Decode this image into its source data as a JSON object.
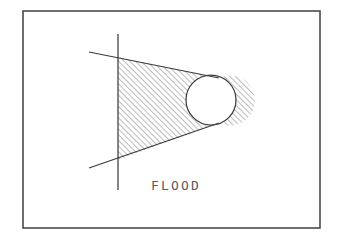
{
  "figure": {
    "caption": "FLOOD",
    "background_color": "#ffffff",
    "line_color": "#3c3c3c",
    "frame_color": "#4a4a4a",
    "hatch_color": "#555555",
    "frame": {
      "x": 23,
      "y": 11,
      "width": 297,
      "height": 217
    },
    "vertical_line": {
      "x": 118,
      "y1": 34,
      "y2": 190
    },
    "upper_tangent": {
      "x1": 89,
      "y1": 52,
      "x2": 219,
      "y2": 78
    },
    "lower_tangent": {
      "x1": 89,
      "y1": 168,
      "x2": 219,
      "y2": 123
    },
    "circle": {
      "cx": 211,
      "cy": 100,
      "r": 25
    },
    "hatch_angle_degrees": 45,
    "hatch_spacing": 4,
    "caption_position": {
      "x": 151,
      "y": 190
    }
  }
}
